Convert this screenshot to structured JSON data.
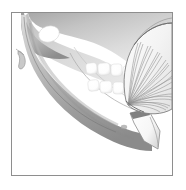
{
  "figure": {
    "domain": "anatomical-illustration",
    "frame": {
      "border_color": "#8e8e8e",
      "background_color": "#ffffff",
      "x": 11,
      "y": 12,
      "width": 162,
      "height": 164
    },
    "palette": {
      "bone_light": "#e3e3e3",
      "bone_mid": "#c2c2c2",
      "bone_dark": "#9a9a9a",
      "bone_shadow": "#7d7d7d",
      "tooth_white": "#ffffff",
      "muscle_fill": "#f2f2f2",
      "muscle_line": "#8a8a8a",
      "outline": "#6f6f6f",
      "flap_white": "#fcfcfc",
      "page_background": "#ffffff"
    },
    "parts": [
      {
        "id": "maxilla-upper-block",
        "label": "Upper jaw / maxilla region",
        "description": "Large shaded mass filling the upper portion of the frame"
      },
      {
        "id": "coronoid-notch-highlight",
        "label": "Coronoid notch highlight",
        "description": "Bright white rounded wedge near the upper left"
      },
      {
        "id": "styloid-hook",
        "label": "Styloid process hook",
        "description": "Small hook shape projecting at the left edge"
      },
      {
        "id": "mandible-body",
        "label": "Mandible body",
        "description": "Curved crescent of bone sweeping from upper left down to lower right"
      },
      {
        "id": "upper-teeth-row",
        "label": "Upper teeth row",
        "description": "Row of four bright white molar crowns"
      },
      {
        "id": "lower-teeth-row",
        "label": "Lower teeth row",
        "description": "Row of three bright white molar crowns"
      },
      {
        "id": "fan-muscle",
        "label": "Fan-shaped masticatory muscle",
        "description": "Fan of radiating fibers attached at the ramus, converging toward the lower left"
      },
      {
        "id": "muscle-insertion-flap",
        "label": "Muscle insertion flap",
        "description": "White strap-like flap folded at the angle of the mandible"
      }
    ],
    "fan_muscle": {
      "fiber_count": 26,
      "origin_x": 126,
      "origin_y": 98,
      "fill": "#f4f4f4",
      "stroke": "#8a8a8a"
    },
    "teeth": {
      "upper": [
        {
          "x": 85,
          "y": 62,
          "w": 11,
          "h": 11
        },
        {
          "x": 97,
          "y": 62,
          "w": 12,
          "h": 12
        },
        {
          "x": 110,
          "y": 63,
          "w": 11,
          "h": 12
        },
        {
          "x": 121,
          "y": 64,
          "w": 8,
          "h": 11
        }
      ],
      "lower": [
        {
          "x": 87,
          "y": 79,
          "w": 11,
          "h": 11
        },
        {
          "x": 99,
          "y": 79,
          "w": 12,
          "h": 12
        },
        {
          "x": 112,
          "y": 80,
          "w": 11,
          "h": 12
        }
      ]
    }
  }
}
